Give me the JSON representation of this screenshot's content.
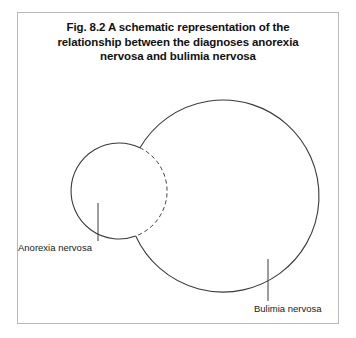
{
  "figure": {
    "number": "Fig. 8.2",
    "caption_lines": [
      "Fig. 8.2  A schematic representation of the",
      "relationship between the diagnoses anorexia",
      "nervosa and bulimia nervosa"
    ],
    "caption_full": "Fig. 8.2  A schematic representation of the relationship between the diagnoses anorexia nervosa and bulimia nervosa",
    "frame_color": "#b9b9b9",
    "background_color": "#ffffff",
    "stroke_color": "#3a3a3a"
  },
  "diagram": {
    "type": "venn",
    "sets": [
      {
        "id": "anorexia",
        "label": "Anorexia nervosa",
        "cx": 119,
        "cy": 191,
        "r": 48,
        "hidden_arc_inside_other": false,
        "dashed_arc_inside_other": true,
        "leader_line": {
          "x": 98,
          "y1": 203,
          "y2": 241
        },
        "label_x": 18,
        "label_y": 242
      },
      {
        "id": "bulimia",
        "label": "Bulimia nervosa",
        "cx": 223,
        "cy": 196,
        "r": 96,
        "hidden_arc_inside_other": true,
        "dashed_arc_inside_other": false,
        "leader_line": {
          "x": 268,
          "y1": 259,
          "y2": 301
        },
        "label_x": 254,
        "label_y": 303
      }
    ],
    "relationship": "overlapping"
  }
}
